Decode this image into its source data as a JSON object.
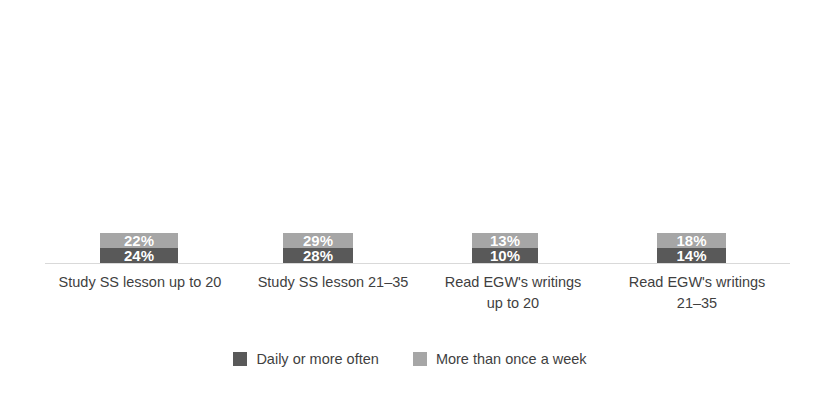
{
  "chart_data": {
    "type": "bar",
    "subtype": "stacked-bar",
    "title": "",
    "subtitle": "",
    "xlabel": "",
    "ylabel": "",
    "ylim": [
      0,
      100
    ],
    "grid": false,
    "legend_position": "bottom",
    "value_suffix": "%",
    "categories": [
      "Study SS lesson up to 20",
      "Study SS lesson  21–35",
      "Read EGW's writings\nup to 20",
      "Read EGW's writings\n21–35"
    ],
    "series": [
      {
        "name": "Daily or more often",
        "color": "#595959",
        "values": [
          24,
          28,
          10,
          14
        ],
        "labels": [
          "24%",
          "28%",
          "10%",
          "14%"
        ]
      },
      {
        "name": "More than once a week",
        "color": "#a6a6a6",
        "values": [
          22,
          29,
          13,
          18
        ],
        "labels": [
          "22%",
          "29%",
          "13%",
          "18%"
        ]
      }
    ],
    "totals": [
      46,
      57,
      23,
      32
    ],
    "axis_color": "#d9d9d9",
    "label_text_color": "#ffffff",
    "background": "#ffffff"
  },
  "layout": {
    "bars": [
      {
        "left": 100,
        "width": 78
      },
      {
        "left": 283,
        "width": 70
      },
      {
        "left": 472,
        "width": 66
      },
      {
        "left": 657,
        "width": 69
      }
    ],
    "cat_labels": [
      {
        "left": 40,
        "width": 200,
        "top": 272
      },
      {
        "left": 243,
        "width": 180,
        "top": 272
      },
      {
        "left": 428,
        "width": 170,
        "top": 272
      },
      {
        "left": 612,
        "width": 170,
        "top": 272
      }
    ],
    "px_per_percent": 4.2,
    "baseline_y": 263
  },
  "legend": {
    "items": [
      {
        "label": "Daily or more often",
        "color": "#595959",
        "swatch_name": "legend-swatch-daily"
      },
      {
        "label": "More than once a week",
        "color": "#a6a6a6",
        "swatch_name": "legend-swatch-weekly"
      }
    ]
  }
}
